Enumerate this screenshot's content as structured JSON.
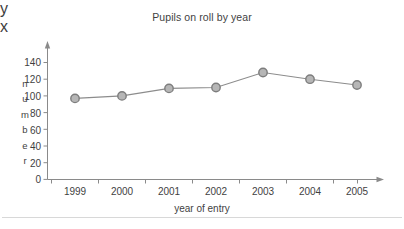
{
  "chart_data": {
    "type": "line",
    "title": "Pupils on roll by year",
    "xlabel": "year of entry",
    "ylabel": "number",
    "x_axis_letter": "y",
    "y_axis_letter": "x",
    "categories": [
      "1999",
      "2000",
      "2001",
      "2002",
      "2003",
      "2004",
      "2005"
    ],
    "values": [
      97,
      100,
      109,
      110,
      128,
      120,
      113
    ],
    "series": [
      {
        "name": "Pupils on roll",
        "values": [
          97,
          100,
          109,
          110,
          128,
          120,
          113
        ]
      }
    ],
    "ylim": [
      0,
      140
    ],
    "ytick_labels": [
      "0",
      "20",
      "40",
      "60",
      "80",
      "100",
      "120",
      "140"
    ],
    "ytick_values": [
      0,
      20,
      40,
      60,
      80,
      100,
      120,
      140
    ],
    "ystep": 20,
    "grid": false,
    "legend": "none",
    "marker": "circle",
    "line_color": "#8c8c8c",
    "marker_fill": "#b6b6b6",
    "marker_stroke": "#7d7d7d",
    "axis_color": "#8a8a8a",
    "text_color": "#3f3f3f",
    "ylabel_letters": [
      "n",
      "u",
      "m",
      "b",
      "e",
      "r"
    ]
  }
}
